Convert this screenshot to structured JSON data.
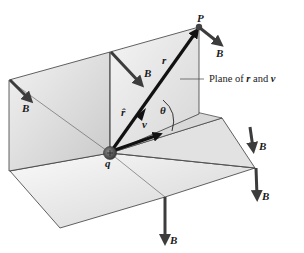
{
  "figure": {
    "labels": {
      "P": "P",
      "r": "r",
      "r_hat": "r̂",
      "v": "v",
      "theta": "θ",
      "q": "q",
      "B": "B",
      "plane_caption_prefix": "Plane of ",
      "plane_caption_r": "r",
      "plane_caption_and": " and ",
      "plane_caption_v": "v"
    },
    "b_vector_count": 6,
    "colors": {
      "plane_fill_light": "#ececec",
      "plane_fill_dark": "#cfcfcf",
      "edge": "#3a3a3a",
      "vector": "#111111",
      "b_vector": "#3c3c3c",
      "charge": "#555555"
    }
  }
}
